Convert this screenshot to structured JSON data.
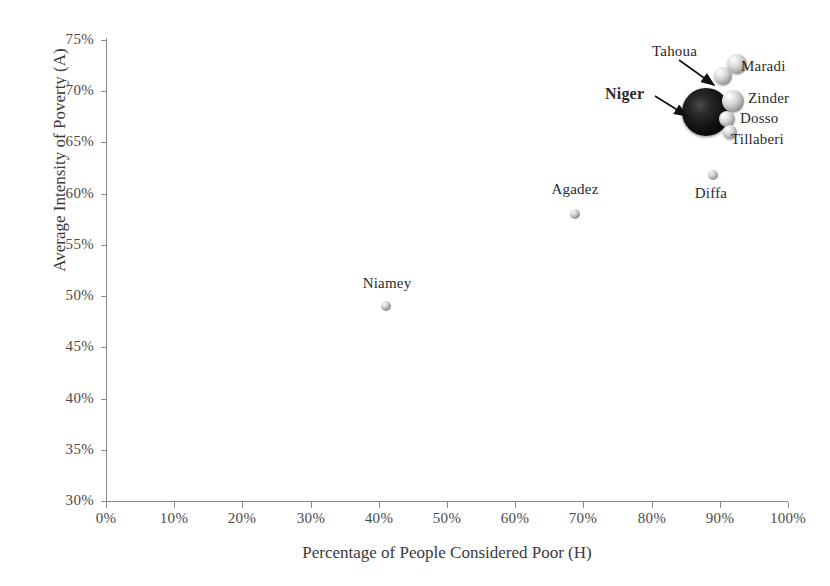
{
  "chart_data": {
    "type": "scatter",
    "title": "",
    "xlabel": "Percentage of People Considered Poor (H)",
    "ylabel": "Average Intensity of Poverty (A)",
    "xlim": [
      0,
      100
    ],
    "ylim": [
      30,
      75
    ],
    "xticks": [
      "0%",
      "10%",
      "20%",
      "30%",
      "40%",
      "50%",
      "60%",
      "70%",
      "80%",
      "90%",
      "100%"
    ],
    "yticks": [
      "30%",
      "35%",
      "40%",
      "45%",
      "50%",
      "55%",
      "60%",
      "65%",
      "70%",
      "75%"
    ],
    "xtick_values": [
      0,
      10,
      20,
      30,
      40,
      50,
      60,
      70,
      80,
      90,
      100
    ],
    "ytick_values": [
      30,
      35,
      40,
      45,
      50,
      55,
      60,
      65,
      70,
      75
    ],
    "grid": false,
    "legend": "none",
    "bubble_size_meaning": "number of poor people / population share",
    "points": [
      {
        "name": "Niger",
        "x": 88.0,
        "y": 68.0,
        "radius_px": 24,
        "shade": "dark",
        "label_bold": true
      },
      {
        "name": "Tahoua",
        "x": 90.5,
        "y": 71.5,
        "radius_px": 9,
        "shade": "light",
        "label_bold": false
      },
      {
        "name": "Maradi",
        "x": 92.5,
        "y": 72.7,
        "radius_px": 10,
        "shade": "light",
        "label_bold": false
      },
      {
        "name": "Zinder",
        "x": 92.0,
        "y": 69.0,
        "radius_px": 11,
        "shade": "light",
        "label_bold": false
      },
      {
        "name": "Dosso",
        "x": 91.0,
        "y": 67.3,
        "radius_px": 8,
        "shade": "light",
        "label_bold": false
      },
      {
        "name": "Tillaberi",
        "x": 91.5,
        "y": 66.0,
        "radius_px": 7,
        "shade": "light",
        "label_bold": false
      },
      {
        "name": "Diffa",
        "x": 89.0,
        "y": 61.8,
        "radius_px": 5,
        "shade": "tiny",
        "label_bold": false
      },
      {
        "name": "Agadez",
        "x": 68.7,
        "y": 58.0,
        "radius_px": 5,
        "shade": "tiny",
        "label_bold": false
      },
      {
        "name": "Niamey",
        "x": 41.0,
        "y": 49.0,
        "radius_px": 5,
        "shade": "tiny",
        "label_bold": false
      }
    ],
    "annotations": [
      {
        "text": "Niger",
        "kind": "arrow-label",
        "points_to": "Niger"
      },
      {
        "text": "Tahoua",
        "kind": "arrow-label",
        "points_to": "Tahoua"
      }
    ]
  },
  "labels": {
    "niger": "Niger",
    "tahoua": "Tahoua",
    "maradi": "Maradi",
    "zinder": "Zinder",
    "dosso": "Dosso",
    "tillaberi": "Tillaberi",
    "diffa": "Diffa",
    "agadez": "Agadez",
    "niamey": "Niamey"
  },
  "axes": {
    "x_title": "Percentage of People Considered Poor (H)",
    "y_title": "Average Intensity of Poverty (A)",
    "x_ticks": [
      "0%",
      "10%",
      "20%",
      "30%",
      "40%",
      "50%",
      "60%",
      "70%",
      "80%",
      "90%",
      "100%"
    ],
    "y_ticks": [
      "75%",
      "70%",
      "65%",
      "60%",
      "55%",
      "50%",
      "45%",
      "40%",
      "35%",
      "30%"
    ]
  }
}
